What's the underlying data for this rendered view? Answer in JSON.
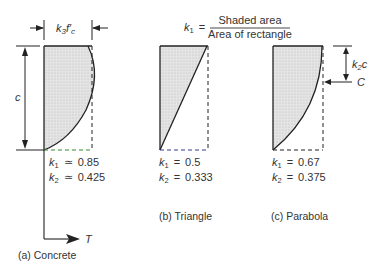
{
  "formula": {
    "lhs": "k",
    "lhs_sub": "1",
    "equals": "=",
    "numerator": "Shaded area",
    "denominator": "Area of rectangle"
  },
  "panels": [
    {
      "id": "a",
      "caption": "(a)  Concrete",
      "shape": "concrete",
      "k1_label": "k",
      "k1_sub": "1",
      "k1_op": "≃",
      "k1_value": "0.85",
      "k2_label": "k",
      "k2_sub": "2",
      "k2_op": "≃",
      "k2_value": "0.425",
      "width_label_k": "k",
      "width_label_sub": "3",
      "width_label_f": "f′",
      "width_label_fsub": "c",
      "depth_label": "c",
      "axis_label": "T"
    },
    {
      "id": "b",
      "caption": "(b)  Triangle",
      "shape": "triangle",
      "k1_label": "k",
      "k1_sub": "1",
      "k1_op": "=",
      "k1_value": "0.5",
      "k2_label": "k",
      "k2_sub": "2",
      "k2_op": "=",
      "k2_value": "0.333"
    },
    {
      "id": "c",
      "caption": "(c)  Parabola",
      "shape": "parabola",
      "k1_label": "k",
      "k1_sub": "1",
      "k1_op": "=",
      "k1_value": "0.67",
      "k2_label": "k",
      "k2_sub": "2",
      "k2_op": "=",
      "k2_value": "0.375",
      "resultant_label": "C",
      "offset_label_k": "k",
      "offset_label_sub": "2",
      "offset_label_c": "c"
    }
  ],
  "colors": {
    "fill": "#dcdcdc",
    "line": "#222222",
    "baseline_a": "#2e8b2e",
    "baseline_b": "#2f3f8f",
    "baseline_c": "#222222"
  }
}
